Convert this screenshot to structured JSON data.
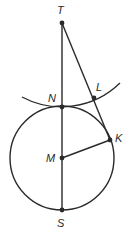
{
  "diagram": {
    "type": "geometry",
    "stroke_color": "#2a2a2a",
    "background": "#ffffff",
    "points": [
      {
        "label": "T",
        "x": 62,
        "y": 23,
        "label_x": 57,
        "label_y": 14
      },
      {
        "label": "N",
        "x": 62,
        "y": 107,
        "label_x": 48,
        "label_y": 102
      },
      {
        "label": "L",
        "x": 94,
        "y": 98,
        "label_x": 96,
        "label_y": 91
      },
      {
        "label": "K",
        "x": 110,
        "y": 140,
        "label_x": 115,
        "label_y": 142
      },
      {
        "label": "M",
        "x": 62,
        "y": 158,
        "label_x": 46,
        "label_y": 162
      },
      {
        "label": "S",
        "x": 62,
        "y": 210,
        "label_x": 57,
        "label_y": 227
      }
    ],
    "segments": [
      {
        "from": "T",
        "to": "S"
      },
      {
        "from": "T",
        "to": "K"
      },
      {
        "from": "M",
        "to": "K"
      }
    ],
    "circle": {
      "center": "M",
      "radius": 52
    },
    "arc": {
      "center": "T",
      "radius": 84,
      "start": [
        22,
        97
      ],
      "end": [
        120,
        83
      ]
    }
  }
}
